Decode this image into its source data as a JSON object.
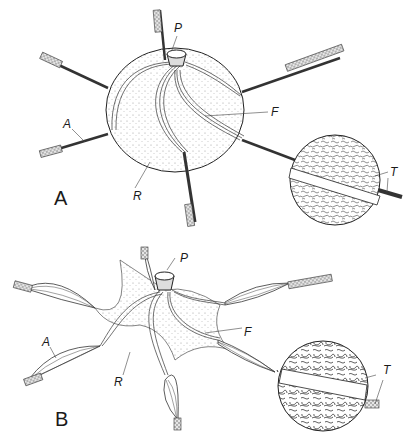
{
  "figure": {
    "panels": [
      {
        "id": "A",
        "panel_label": "A",
        "labels": {
          "P": "P",
          "F": "F",
          "A": "A",
          "R": "R",
          "T": "T"
        }
      },
      {
        "id": "B",
        "panel_label": "B",
        "labels": {
          "P": "P",
          "F": "F",
          "A": "A",
          "R": "R",
          "T": "T"
        }
      }
    ],
    "colors": {
      "ink": "#1a1a1a",
      "stipple": "#9a9a9a",
      "fill": "#ededed",
      "background": "#ffffff"
    }
  }
}
